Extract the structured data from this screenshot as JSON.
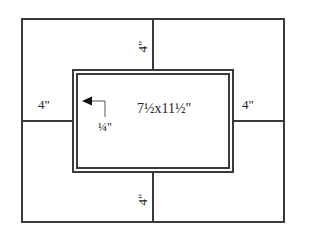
{
  "diagram": {
    "type": "picture-frame-mat-layout",
    "colors": {
      "line": "#3a3a3a",
      "text": "#222222",
      "background": "#ffffff"
    },
    "labels": {
      "top_border": "4\"",
      "bottom_border": "4\"",
      "left_border": "4\"",
      "right_border": "4\"",
      "opening_size": "7½x11½\"",
      "reveal": "¼\""
    },
    "icons": {
      "reveal_arrow": "arrow-left-icon"
    }
  }
}
